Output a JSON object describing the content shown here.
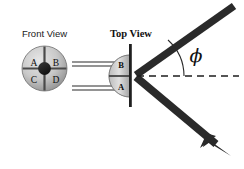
{
  "figure": {
    "kind": "physics-detector-schematic",
    "background_color": "#ffffff",
    "labels": {
      "front_view": "Front View",
      "top_view": "Top View",
      "angle_symbol": "ϕ"
    },
    "front_view": {
      "name": "quadrant-detector-front",
      "center_x": 44.5,
      "center_y": 68.5,
      "radius": 22.5,
      "hub_radius": 6.2,
      "quadrants": [
        {
          "id": "A",
          "label": "A",
          "position": "top-left"
        },
        {
          "id": "B",
          "label": "B",
          "position": "top-right"
        },
        {
          "id": "C",
          "label": "C",
          "position": "bottom-left"
        },
        {
          "id": "D",
          "label": "D",
          "position": "bottom-right"
        }
      ],
      "divider_color": "#4a4a4a",
      "fill_light": "#d8d8d8",
      "fill_dark": "#8e8e8e",
      "hub_color": "#1c1c1c"
    },
    "top_view": {
      "name": "quadrant-detector-top",
      "center_x": 130,
      "center_y": 76,
      "radius": 21,
      "segments": [
        {
          "id": "B",
          "label": "B",
          "position": "upper"
        },
        {
          "id": "A",
          "label": "A",
          "position": "lower"
        }
      ],
      "mount_bar": {
        "x": 130,
        "y_top": 44,
        "y_bottom": 107,
        "width": 2.6,
        "color": "#1f1f1f"
      },
      "fill_light": "#dcdcdc",
      "fill_dark": "#8a8a8a"
    },
    "leads": {
      "name": "detector-leads",
      "count": 4,
      "color": "#2b2b2b",
      "x_start": 72,
      "x_end": 116,
      "y_values": [
        62,
        66,
        86,
        90
      ]
    },
    "beam": {
      "color": "#2a2a2a",
      "thickness": 7.5,
      "vertex": {
        "x": 135,
        "y": 76
      },
      "incoming": {
        "from_x": 234,
        "from_y": 6,
        "to_x": 135,
        "to_y": 76,
        "direction": "toward-detector"
      },
      "outgoing": {
        "from_x": 135,
        "from_y": 76,
        "to_x": 226,
        "to_y": 152,
        "direction": "away-from-detector",
        "has_arrowhead": true
      }
    },
    "reference_axis": {
      "name": "optical-axis",
      "style": "dashed",
      "x_start": 137,
      "x_end": 239,
      "y": 76,
      "color": "#1e1e1e",
      "dash": "7 5"
    },
    "angle_arc": {
      "name": "phi-angle-arc",
      "vertex_x": 135,
      "vertex_y": 76,
      "radius": 49,
      "color": "#2a2a2a",
      "label": "ϕ",
      "label_x": 196,
      "label_y": 56
    }
  }
}
